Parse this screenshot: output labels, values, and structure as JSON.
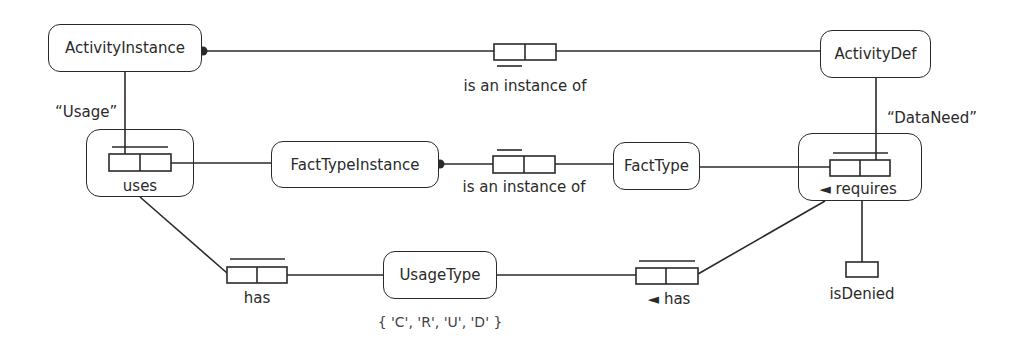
{
  "diagram": {
    "type": "ORM fact-based model",
    "entities": [
      {
        "id": "activity-instance",
        "label": "ActivityInstance"
      },
      {
        "id": "activity-def",
        "label": "ActivityDef"
      },
      {
        "id": "fact-type-instance",
        "label": "FactTypeInstance"
      },
      {
        "id": "fact-type",
        "label": "FactType"
      },
      {
        "id": "usage-type",
        "label": "UsageType"
      }
    ],
    "fact_types": [
      {
        "id": "activity-instance-of",
        "reading": "is an instance of",
        "objectified_name": ""
      },
      {
        "id": "uses",
        "reading": "uses",
        "objectified_name": "“Usage”"
      },
      {
        "id": "fact-instance-of",
        "reading": "is an instance of",
        "objectified_name": ""
      },
      {
        "id": "requires",
        "reading": "◄ requires",
        "objectified_name": "“DataNeed”"
      },
      {
        "id": "usage-has",
        "reading": "has"
      },
      {
        "id": "dataneed-has",
        "reading": "◄ has"
      },
      {
        "id": "is-denied",
        "reading": "isDenied"
      }
    ],
    "value_constraint": "{ 'C', 'R', 'U', 'D' }",
    "colors": {
      "stroke": "#2a2a2a",
      "background": "#ffffff"
    }
  }
}
